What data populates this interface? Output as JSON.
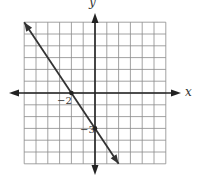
{
  "chart_data": {
    "type": "line",
    "title": "",
    "xlabel": "x",
    "ylabel": "y",
    "grid": true,
    "xlim": [
      -6,
      6
    ],
    "ylim": [
      -6,
      6
    ],
    "series": [
      {
        "name": "line",
        "equation": "y = -1.5x - 3",
        "x": [
          -6,
          2
        ],
        "y": [
          6,
          -6
        ]
      }
    ],
    "points": [
      {
        "x": -2,
        "y": 0,
        "label": "−2"
      },
      {
        "x": 0,
        "y": -3,
        "label": "−3"
      }
    ],
    "annotations": [
      "−2",
      "−3"
    ]
  },
  "labels": {
    "x_axis": "x",
    "y_axis": "y",
    "x_intercept": "−2",
    "y_intercept": "−3"
  },
  "colors": {
    "grid": "#8a8a8a",
    "axis": "#222222",
    "line": "#333333"
  }
}
